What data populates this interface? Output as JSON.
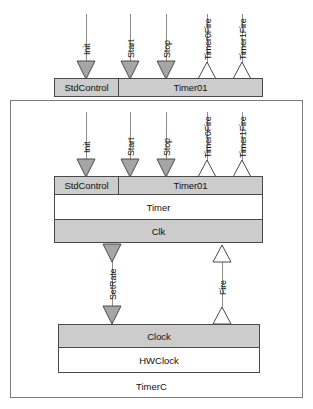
{
  "diagram": {
    "outer_component_label": "TimerC",
    "colors": {
      "interface_fill": "#cccccc",
      "module_fill": "#ffffff",
      "arrow_filled": "#a6a6a6",
      "arrow_open": "#ffffff",
      "line": "#8d8d8d",
      "border": "#4a4a4a",
      "outline": "#7a7a7a",
      "background": "#ffffff"
    },
    "top_component": {
      "name": "top-provided-interfaces",
      "interfaces": [
        {
          "label": "StdControl"
        },
        {
          "label": "Timer01"
        }
      ]
    },
    "top_signals": [
      {
        "label": "Init",
        "direction": "down",
        "style": "filled"
      },
      {
        "label": "Start",
        "direction": "down",
        "style": "filled"
      },
      {
        "label": "Stop",
        "direction": "down",
        "style": "filled"
      },
      {
        "label": "Timer0Fire",
        "direction": "up",
        "style": "open"
      },
      {
        "label": "Timer1Fire",
        "direction": "up",
        "style": "open"
      }
    ],
    "timer_module": {
      "name": "timer-module",
      "provided_interfaces": [
        {
          "label": "StdControl"
        },
        {
          "label": "Timer01"
        }
      ],
      "module_label": "Timer",
      "used_interfaces": [
        {
          "label": "Clk"
        }
      ]
    },
    "mid_signals": [
      {
        "label": "SetRate",
        "direction": "down",
        "style": "filled"
      },
      {
        "label": "Fire",
        "direction": "up",
        "style": "open"
      }
    ],
    "clock_module": {
      "name": "hwclock-module",
      "provided_interfaces": [
        {
          "label": "Clock"
        }
      ],
      "module_label": "HWClock"
    }
  }
}
